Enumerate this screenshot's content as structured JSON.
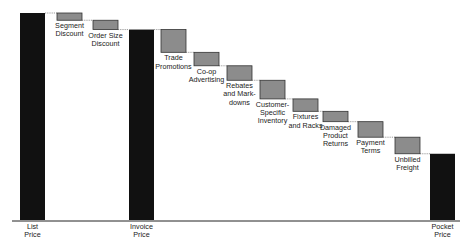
{
  "chart_data": {
    "type": "bar",
    "subtype": "waterfall",
    "title": "",
    "xlabel": "",
    "ylabel": "",
    "grid": false,
    "legend": "none",
    "ylim": [
      0,
      100
    ],
    "categories": [
      "List Price",
      "Segment Discount",
      "Order Size Discount",
      "Invoice Price",
      "Trade Promotions",
      "Co-op Advertising",
      "Rebates and Mark-downs",
      "Customer-Specific Inventory",
      "Fixtures and Racks",
      "Damaged Product Returns",
      "Payment Terms",
      "Unbilled Freight",
      "Pocket Price"
    ],
    "labels": [
      "List\nPrice",
      "Segment\nDiscount",
      "Order Size\nDiscount",
      "Invoice\nPrice",
      "Trade\nPromotions",
      "Co-op\nAdvertising",
      "Rebates\nand Mark-\ndowns",
      "Customer-\nSpecific\nInventory",
      "Fixtures\nand Racks",
      "Damaged\nProduct\nReturns",
      "Payment\nTerms",
      "Unbilled\nFreight",
      "Pocket\nPrice"
    ],
    "bar_kind": [
      "total",
      "decrease",
      "decrease",
      "total",
      "decrease",
      "decrease",
      "decrease",
      "decrease",
      "decrease",
      "decrease",
      "decrease",
      "decrease",
      "total"
    ],
    "values": [
      100,
      -3.5,
      -4.5,
      92,
      -11,
      -6.5,
      -7,
      -9,
      -6,
      -5,
      -7.5,
      -8,
      32
    ],
    "running_top": [
      100,
      100,
      96.5,
      92,
      92,
      81,
      74.5,
      67.5,
      58.5,
      52.5,
      47.5,
      40,
      32
    ],
    "running_bottom": [
      0,
      96.5,
      92,
      0,
      81,
      74.5,
      67.5,
      58.5,
      52.5,
      47.5,
      40,
      32,
      0
    ],
    "colors": {
      "total": "#111111",
      "decrease": "#8c8c8c",
      "decrease_border": "#333333",
      "connector": "#555555",
      "axis": "#222222"
    }
  }
}
